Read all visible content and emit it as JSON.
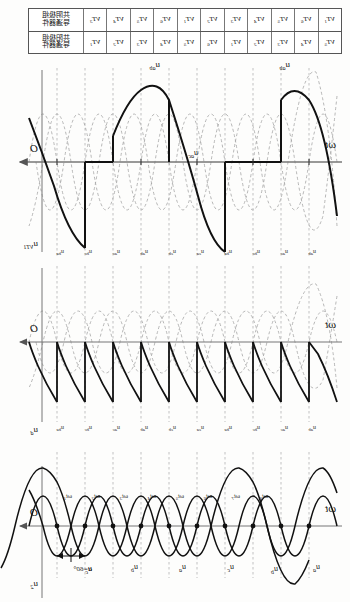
{
  "figure": {
    "firing_angle_label": "α=60°",
    "origin_label": "O",
    "time_axis_label": "ωt"
  },
  "conduction_table": {
    "header_rows": [
      "共阴极组\n导通器件",
      "共阳极组\n导通器件"
    ],
    "header_top": "共阴极组",
    "header_top2": "导通器件",
    "header_bot": "共阳极组",
    "header_bot2": "导通器件",
    "row_top": [
      "VT1",
      "VT6",
      "VT5",
      "VT4",
      "VT3",
      "VT2",
      "VT1",
      "VT6",
      "VT5",
      "VT4",
      "VT3"
    ],
    "row_bottom": [
      "VT5",
      "VT4",
      "VT3",
      "VT2",
      "VT1",
      "VT6",
      "VT5",
      "VT4",
      "VT3",
      "VT2",
      "VT1"
    ]
  },
  "panels": [
    {
      "id": "panel-uvt1",
      "y_label": "uVT1",
      "y_label_base": "u",
      "y_label_sub": "VT1",
      "curve_labels": [
        "uab",
        "uab",
        "uac"
      ],
      "tick_labels": [
        "ua",
        "ub",
        "uc",
        "ua",
        "ub",
        "uc",
        "ua",
        "ub",
        "uc",
        "ua",
        "ub"
      ]
    },
    {
      "id": "panel-ud",
      "y_label": "ud",
      "y_label_base": "u",
      "y_label_sub": "d",
      "tick_labels": [
        "uab",
        "uac",
        "ubc",
        "uba",
        "uca",
        "ucb",
        "uab",
        "uac",
        "ubc",
        "uba",
        "uca"
      ]
    },
    {
      "id": "panel-u2",
      "y_label": "u2",
      "y_label_base": "u",
      "y_label_sub": "2",
      "phase_labels": [
        "ua",
        "ub",
        "uc",
        "ua",
        "ub",
        "uc"
      ],
      "time_ticks": [
        "ωt1",
        "ωt2",
        "ωt3",
        "ωt4",
        "ωt5",
        "ωt6",
        "ωt7",
        "ωt8"
      ]
    }
  ],
  "colors": {
    "curve": "#111111",
    "dashed": "#9a9a9a",
    "axis": "#666666",
    "table_border": "#555555"
  }
}
